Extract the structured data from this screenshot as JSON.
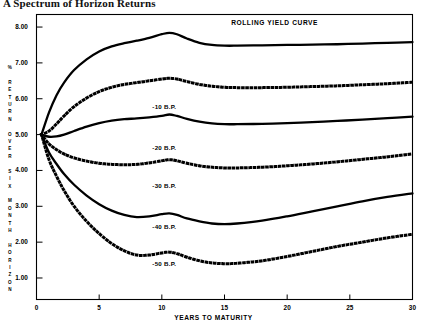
{
  "title": "A Spectrum of Horizon Returns",
  "chart_data": {
    "type": "line",
    "title": "A Spectrum of Horizon Returns",
    "xlabel": "YEARS TO MATURITY",
    "ylabel": "% RETURN OVER SIX MONTH HORIZON",
    "xlim": [
      0,
      30
    ],
    "ylim": [
      0.4,
      8.35
    ],
    "xticks": [
      0,
      5,
      10,
      15,
      20,
      25,
      30
    ],
    "xticklabels": [
      "0",
      "5",
      "10",
      "15",
      "20",
      "25",
      "30"
    ],
    "yticks": [
      1.0,
      2.0,
      3.0,
      4.0,
      5.0,
      6.0,
      7.0,
      8.0
    ],
    "yticklabels": [
      "1.00",
      "2.00",
      "3.00",
      "4.00",
      "5.00",
      "6.00",
      "7.00",
      "8.00"
    ],
    "grid": false,
    "legend": "inline-annotations",
    "annotations": [
      {
        "text": "ROLLING YIELD CURVE",
        "x": 19.0,
        "y": 8.12
      },
      {
        "text": "-10 B.P.",
        "x": 10.2,
        "y": 5.78
      },
      {
        "text": "-20 B.P.",
        "x": 10.2,
        "y": 4.62
      },
      {
        "text": "-30 B.P.",
        "x": 10.2,
        "y": 3.58
      },
      {
        "text": "-40 B.P.",
        "x": 10.2,
        "y": 2.42
      },
      {
        "text": "-50 B.P.",
        "x": 10.2,
        "y": 1.4
      }
    ],
    "series": [
      {
        "name": "ROLLING YIELD CURVE",
        "style": "solid",
        "x": [
          0.4,
          1.0,
          1.6,
          2.2,
          3.0,
          4.0,
          5.0,
          6.0,
          7.0,
          8.0,
          9.0,
          10.0,
          10.6,
          11.2,
          12.0,
          13.0,
          14.0,
          15.0,
          16.0,
          18.0,
          20.0,
          22.0,
          24.0,
          26.0,
          28.0,
          30.0
        ],
        "values": [
          5.0,
          5.62,
          6.1,
          6.45,
          6.8,
          7.1,
          7.32,
          7.46,
          7.55,
          7.62,
          7.7,
          7.8,
          7.84,
          7.8,
          7.68,
          7.56,
          7.5,
          7.48,
          7.48,
          7.49,
          7.5,
          7.51,
          7.52,
          7.54,
          7.56,
          7.58
        ]
      },
      {
        "name": "-10 B.P.",
        "style": "dotted",
        "x": [
          0.4,
          1.0,
          1.6,
          2.2,
          3.0,
          4.0,
          5.0,
          6.0,
          7.0,
          8.0,
          9.0,
          10.0,
          10.6,
          11.2,
          12.0,
          13.0,
          14.0,
          15.0,
          16.0,
          18.0,
          20.0,
          22.0,
          24.0,
          26.0,
          28.0,
          30.0
        ],
        "values": [
          5.0,
          5.1,
          5.3,
          5.52,
          5.78,
          6.02,
          6.2,
          6.32,
          6.4,
          6.45,
          6.5,
          6.55,
          6.57,
          6.55,
          6.48,
          6.4,
          6.35,
          6.32,
          6.31,
          6.31,
          6.32,
          6.34,
          6.36,
          6.39,
          6.42,
          6.46
        ]
      },
      {
        "name": "-20 B.P.",
        "style": "solid",
        "x": [
          0.4,
          1.0,
          1.6,
          2.2,
          3.0,
          4.0,
          5.0,
          6.0,
          7.0,
          8.0,
          9.0,
          10.0,
          10.6,
          11.2,
          12.0,
          13.0,
          14.0,
          15.0,
          16.0,
          18.0,
          20.0,
          22.0,
          24.0,
          26.0,
          28.0,
          30.0
        ],
        "values": [
          5.0,
          4.94,
          4.95,
          5.0,
          5.1,
          5.22,
          5.32,
          5.39,
          5.43,
          5.45,
          5.48,
          5.52,
          5.56,
          5.52,
          5.44,
          5.36,
          5.31,
          5.29,
          5.29,
          5.3,
          5.32,
          5.35,
          5.38,
          5.42,
          5.46,
          5.5
        ]
      },
      {
        "name": "-30 B.P.",
        "style": "dotted",
        "x": [
          0.4,
          1.0,
          1.6,
          2.2,
          3.0,
          4.0,
          5.0,
          6.0,
          7.0,
          8.0,
          9.0,
          10.0,
          10.6,
          11.2,
          12.0,
          13.0,
          14.0,
          15.0,
          16.0,
          18.0,
          20.0,
          22.0,
          24.0,
          26.0,
          28.0,
          30.0
        ],
        "values": [
          5.0,
          4.74,
          4.58,
          4.46,
          4.35,
          4.26,
          4.2,
          4.17,
          4.16,
          4.17,
          4.21,
          4.27,
          4.3,
          4.27,
          4.2,
          4.13,
          4.09,
          4.07,
          4.07,
          4.09,
          4.13,
          4.18,
          4.24,
          4.31,
          4.38,
          4.46
        ]
      },
      {
        "name": "-40 B.P.",
        "style": "solid",
        "x": [
          0.4,
          1.0,
          1.6,
          2.2,
          3.0,
          4.0,
          5.0,
          6.0,
          7.0,
          8.0,
          9.0,
          10.0,
          10.6,
          11.2,
          12.0,
          13.0,
          14.0,
          15.0,
          16.0,
          18.0,
          20.0,
          22.0,
          24.0,
          26.0,
          28.0,
          30.0
        ],
        "values": [
          5.0,
          4.5,
          4.18,
          3.9,
          3.6,
          3.3,
          3.06,
          2.88,
          2.76,
          2.7,
          2.72,
          2.78,
          2.8,
          2.76,
          2.66,
          2.58,
          2.52,
          2.5,
          2.52,
          2.6,
          2.72,
          2.86,
          3.0,
          3.14,
          3.26,
          3.36
        ]
      },
      {
        "name": "-50 B.P.",
        "style": "dotted",
        "x": [
          0.4,
          1.0,
          1.6,
          2.2,
          3.0,
          4.0,
          5.0,
          6.0,
          7.0,
          8.0,
          9.0,
          10.0,
          10.6,
          11.2,
          12.0,
          13.0,
          14.0,
          15.0,
          16.0,
          18.0,
          20.0,
          22.0,
          24.0,
          26.0,
          28.0,
          30.0
        ],
        "values": [
          5.0,
          4.3,
          3.84,
          3.44,
          3.0,
          2.58,
          2.24,
          1.96,
          1.76,
          1.64,
          1.64,
          1.7,
          1.72,
          1.68,
          1.58,
          1.48,
          1.42,
          1.4,
          1.41,
          1.48,
          1.6,
          1.74,
          1.88,
          2.0,
          2.12,
          2.22
        ]
      }
    ]
  }
}
